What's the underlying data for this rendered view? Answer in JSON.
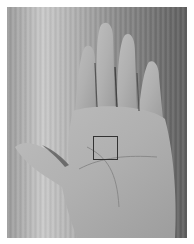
{
  "image": {
    "description": "Grayscale photograph of an open right palm on a wooden surface with a square region-of-interest marker on the palm center",
    "background_color": "#ffffff",
    "roi_box": {
      "x": 93,
      "y": 136,
      "width": 25,
      "height": 24,
      "color": "#333333"
    }
  }
}
